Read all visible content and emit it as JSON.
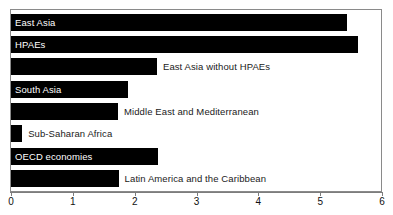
{
  "chart_data": {
    "type": "bar",
    "orientation": "horizontal",
    "title": "",
    "subtitle": "",
    "xlabel": "",
    "ylabel": "",
    "xlim": [
      0,
      6
    ],
    "ylim": null,
    "grid": false,
    "legend": null,
    "bar_color": "#000000",
    "frame_color": "#8a8a8a",
    "axis_color": "#7d7d7d",
    "x_ticks": [
      {
        "value": 0,
        "label": "0"
      },
      {
        "value": 1,
        "label": "1"
      },
      {
        "value": 2,
        "label": "2"
      },
      {
        "value": 3,
        "label": "3"
      },
      {
        "value": 4,
        "label": "4"
      },
      {
        "value": 5,
        "label": "5"
      },
      {
        "value": 6,
        "label": "6"
      }
    ],
    "categories": [
      "East Asia",
      "HPAEs",
      "East Asia without HPAEs",
      "South Asia",
      "Middle East and Mediterranean",
      "Sub-Saharan Africa",
      "OECD economies",
      "Latin America and the Caribbean"
    ],
    "values": [
      5.43,
      5.61,
      2.36,
      1.89,
      1.73,
      0.18,
      2.37,
      1.74
    ],
    "bars": [
      {
        "label": "East Asia",
        "value": 5.43,
        "label_position": "inside"
      },
      {
        "label": "HPAEs",
        "value": 5.61,
        "label_position": "inside"
      },
      {
        "label": "East Asia without HPAEs",
        "value": 2.36,
        "label_position": "outside"
      },
      {
        "label": "South Asia",
        "value": 1.89,
        "label_position": "inside"
      },
      {
        "label": "Middle East and Mediterranean",
        "value": 1.73,
        "label_position": "outside"
      },
      {
        "label": "Sub-Saharan Africa",
        "value": 0.18,
        "label_position": "outside"
      },
      {
        "label": "OECD economies",
        "value": 2.37,
        "label_position": "inside"
      },
      {
        "label": "Latin America and the Caribbean",
        "value": 1.74,
        "label_position": "outside"
      }
    ]
  }
}
